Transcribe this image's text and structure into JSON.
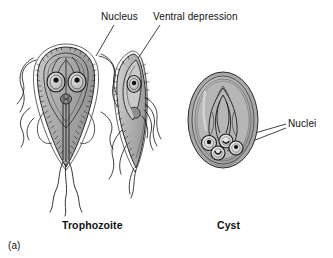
{
  "figure": {
    "panel_id": "(a)",
    "organism": "Giardia lamblia",
    "background_color": "#ffffff",
    "ink_color": "#111111",
    "body_fill_color": "#b0b0b0",
    "body_highlight_color": "#d8d8d8",
    "body_shadow_color": "#8a8a8a",
    "outline_color": "#2b2b2b"
  },
  "labels": {
    "nucleus": "Nucleus",
    "ventral_depression": "Ventral depression",
    "nuclei": "Nuclei",
    "trophozoite": "Trophozoite",
    "cyst": "Cyst"
  },
  "structures": {
    "trophozoite_frontal": {
      "name": "trophozoite-frontal-view",
      "nuclei_count": 2,
      "features": [
        "sucking disc",
        "two nuclei with karyosomes",
        "median body",
        "axonemes",
        "anterolateral flagella",
        "caudal flagella"
      ]
    },
    "trophozoite_lateral": {
      "name": "trophozoite-lateral-view",
      "nuclei_count": 1,
      "features": [
        "ventral depression",
        "one nucleus",
        "flagella"
      ]
    },
    "cyst": {
      "name": "cyst",
      "nuclei_count": 4,
      "features": [
        "cyst wall",
        "axonemes",
        "median bodies",
        "four nuclei"
      ]
    }
  }
}
